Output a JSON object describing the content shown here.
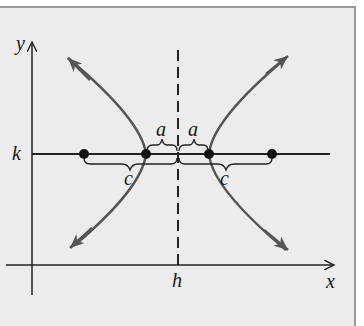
{
  "diagram": {
    "labels": {
      "y_axis": "y",
      "x_axis": "x",
      "k": "k",
      "h": "h",
      "a_left": "a",
      "a_right": "a",
      "c_left": "c",
      "c_right": "c"
    },
    "colors": {
      "background": "#ececec",
      "curve": "#555555",
      "axis": "#222222",
      "frame": "#9a9a9a"
    },
    "geometry": {
      "center_px": [
        178,
        154
      ],
      "vertex_left_px": [
        146,
        154
      ],
      "vertex_right_px": [
        209,
        154
      ],
      "focus_left_px": [
        84,
        154
      ],
      "focus_right_px": [
        272,
        154
      ]
    }
  }
}
